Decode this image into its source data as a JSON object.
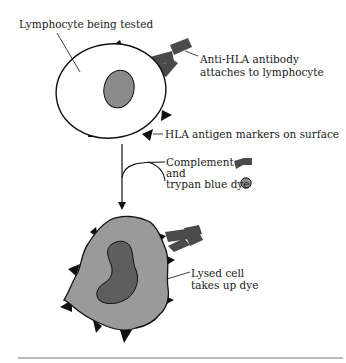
{
  "diagram": {
    "labels": {
      "lymphocyte": "Lymphocyte being tested",
      "antibody_line1": "Anti-HLA antibody",
      "antibody_line2": "attaches to lymphocyte",
      "markers": "HLA antigen markers on surface",
      "complement_line1": "Complement",
      "complement_line2": "and",
      "complement_line3": "trypan blue dye",
      "lysed_line1": "Lysed cell",
      "lysed_line2": "takes up dye"
    },
    "colors": {
      "background": "#ffffff",
      "outline": "#111111",
      "nucleus_intact": "#8a8a8a",
      "lysed_cell": "#9a9a9a",
      "lysed_nucleus": "#5e5e5e",
      "antibody": "#4a4a4a",
      "dye": "#8c8c8c",
      "rule": "#777777"
    }
  }
}
